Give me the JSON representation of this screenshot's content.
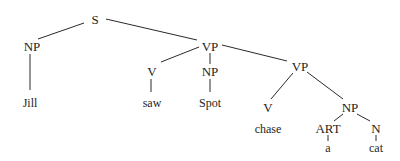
{
  "diagram": {
    "type": "parse-tree",
    "nodes": {
      "s": {
        "label": "S",
        "x": 95,
        "y": 19
      },
      "np1": {
        "label": "NP",
        "x": 32,
        "y": 46
      },
      "jill": {
        "label": "Jill",
        "x": 30,
        "y": 103
      },
      "vp1": {
        "label": "VP",
        "x": 210,
        "y": 46
      },
      "v1": {
        "label": "V",
        "x": 152,
        "y": 71
      },
      "saw": {
        "label": "saw",
        "x": 152,
        "y": 103
      },
      "np2": {
        "label": "NP",
        "x": 210,
        "y": 71
      },
      "spot": {
        "label": "Spot",
        "x": 210,
        "y": 103
      },
      "vp2": {
        "label": "VP",
        "x": 300,
        "y": 66
      },
      "v2": {
        "label": "V",
        "x": 268,
        "y": 107
      },
      "chase": {
        "label": "chase",
        "x": 268,
        "y": 129
      },
      "np3": {
        "label": "NP",
        "x": 350,
        "y": 107
      },
      "art": {
        "label": "ART",
        "x": 328,
        "y": 128
      },
      "a": {
        "label": "a",
        "x": 328,
        "y": 148
      },
      "n": {
        "label": "N",
        "x": 376,
        "y": 128
      },
      "cat": {
        "label": "cat",
        "x": 376,
        "y": 148
      }
    },
    "edges": [
      [
        "s",
        "np1"
      ],
      [
        "s",
        "vp1"
      ],
      [
        "np1",
        "jill"
      ],
      [
        "vp1",
        "v1"
      ],
      [
        "vp1",
        "np2"
      ],
      [
        "vp1",
        "vp2"
      ],
      [
        "v1",
        "saw"
      ],
      [
        "np2",
        "spot"
      ],
      [
        "vp2",
        "v2"
      ],
      [
        "vp2",
        "np3"
      ],
      [
        "np3",
        "art"
      ],
      [
        "np3",
        "n"
      ],
      [
        "art",
        "a"
      ],
      [
        "n",
        "cat"
      ]
    ]
  }
}
